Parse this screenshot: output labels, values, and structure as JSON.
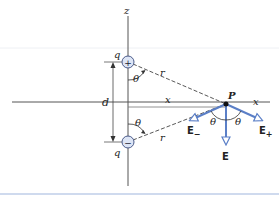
{
  "diagram": {
    "axes": {
      "z_label": "z",
      "x_label": "x"
    },
    "charges": [
      {
        "id": "positive",
        "label": "q",
        "sign": "+"
      },
      {
        "id": "negative",
        "label": "q",
        "sign": "−"
      }
    ],
    "labels": {
      "separation": "d",
      "distance_top": "r",
      "distance_bottom": "r",
      "horizontal": "x",
      "point": "P",
      "angle_top": "θ",
      "angle_bottom": "θ",
      "angle_p_left": "θ",
      "angle_p_right": "θ"
    },
    "vectors": {
      "e_minus": {
        "label": "E",
        "subscript": "−"
      },
      "e_plus": {
        "label": "E",
        "subscript": "+"
      },
      "e_total": {
        "label": "E"
      }
    },
    "colors": {
      "axis": "#555555",
      "vector": "#5b7fc7",
      "charge_fill": "#dde5f5",
      "charge_stroke": "#4a5a8a",
      "bottom_rule": "#9fb6de"
    }
  }
}
